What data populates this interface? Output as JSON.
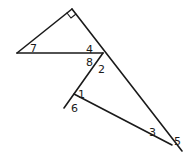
{
  "diagram": {
    "type": "geometry-angles",
    "right_angle_marker": true,
    "angle_labels": [
      {
        "id": "a1",
        "text": "1",
        "x": 78,
        "y": 98
      },
      {
        "id": "a2",
        "text": "2",
        "x": 98,
        "y": 73
      },
      {
        "id": "a3",
        "text": "3",
        "x": 149,
        "y": 136
      },
      {
        "id": "a4",
        "text": "4",
        "x": 86,
        "y": 53
      },
      {
        "id": "a5",
        "text": "5",
        "x": 174,
        "y": 145
      },
      {
        "id": "a6",
        "text": "6",
        "x": 71,
        "y": 112
      },
      {
        "id": "a7",
        "text": "7",
        "x": 30,
        "y": 52
      },
      {
        "id": "a8",
        "text": "8",
        "x": 86,
        "y": 66
      }
    ],
    "colors": {
      "stroke": "#1a1a1a",
      "background": "#ffffff"
    }
  }
}
